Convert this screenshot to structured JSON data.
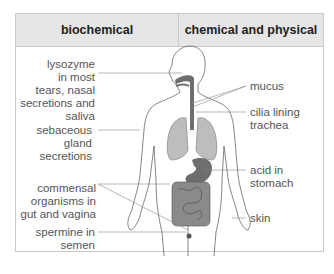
{
  "table": {
    "columns": [
      "biochemical",
      "chemical and physical"
    ]
  },
  "labels": {
    "left": [
      {
        "id": "lysozyme",
        "lines": [
          "lysozyme",
          "in most",
          "tears, nasal",
          "secretions and",
          "saliva"
        ],
        "text": "lysozyme in most tears, nasal secretions and saliva"
      },
      {
        "id": "sebaceous",
        "text": "sebaceous gland secretions"
      },
      {
        "id": "commensal",
        "text": "commensal organisms in gut and vagina"
      },
      {
        "id": "spermine",
        "text": "spermine in semen"
      }
    ],
    "right": [
      {
        "id": "mucus",
        "text": "mucus"
      },
      {
        "id": "cilia",
        "text": "cilia lining trachea"
      },
      {
        "id": "acid",
        "text": "acid in stomach"
      },
      {
        "id": "skin",
        "text": "skin"
      }
    ]
  },
  "colors": {
    "header_bg": "#e6e6e6",
    "border": "#c9c9c9",
    "organ_dark": "#6e6e6e",
    "organ_light": "#bdbdbd",
    "outline": "#555555"
  }
}
